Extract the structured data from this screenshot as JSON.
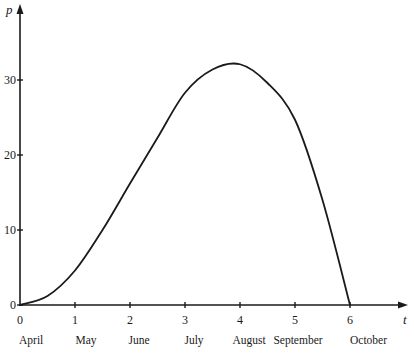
{
  "chart_data": {
    "type": "line",
    "title": "",
    "xlabel": "t",
    "ylabel": "p",
    "xlim": [
      0,
      6
    ],
    "ylim": [
      0,
      30
    ],
    "grid": false,
    "legend": null,
    "x_ticks": [
      0,
      1,
      2,
      3,
      4,
      5,
      6
    ],
    "y_ticks": [
      0,
      10,
      20,
      30
    ],
    "x_tick_labels": [
      "0",
      "1",
      "2",
      "3",
      "4",
      "5",
      "6"
    ],
    "y_tick_labels": [
      "0",
      "10",
      "20",
      "30"
    ],
    "month_labels": [
      "April",
      "May",
      "June",
      "July",
      "August",
      "September",
      "October"
    ],
    "series": [
      {
        "name": "p",
        "x": [
          0,
          0.5,
          1,
          1.5,
          2,
          2.5,
          3,
          3.5,
          4,
          4.5,
          5,
          5.5,
          6
        ],
        "values": [
          0,
          1.2,
          4.6,
          10,
          16.2,
          22.3,
          28.3,
          31.4,
          32.1,
          29.6,
          24.7,
          14,
          0
        ]
      }
    ],
    "colors": {
      "line": "#1a1a1a",
      "axis": "#1a1a1a"
    }
  }
}
